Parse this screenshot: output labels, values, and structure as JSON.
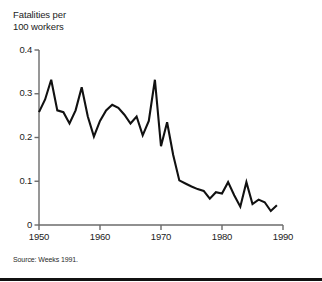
{
  "figure": {
    "title_faint": "",
    "axis_title_line1": "Fatalities per",
    "axis_title_line2": "100 workers",
    "source_note": "Source: Weeks 1991."
  },
  "chart_data": {
    "type": "line",
    "title": "",
    "subtitle": "",
    "xlabel": "",
    "ylabel": "Fatalities per 100 workers",
    "xlim": [
      1950,
      1990
    ],
    "ylim": [
      0,
      0.4
    ],
    "grid": false,
    "legend": "none",
    "line_color": "#111111",
    "axis_color": "#6b6b6b",
    "xticks": [
      1950,
      1960,
      1970,
      1980,
      1990
    ],
    "xtick_labels": [
      "1950",
      "1960",
      "1970",
      "1980",
      "1990"
    ],
    "yticks": [
      0,
      0.1,
      0.2,
      0.3,
      0.4
    ],
    "ytick_labels": [
      "0",
      "0.1",
      "0.2",
      "0.3",
      "0.4"
    ],
    "x": [
      1950,
      1951,
      1952,
      1953,
      1954,
      1955,
      1956,
      1957,
      1958,
      1959,
      1960,
      1961,
      1962,
      1963,
      1964,
      1965,
      1966,
      1967,
      1968,
      1969,
      1970,
      1971,
      1972,
      1973,
      1974,
      1975,
      1976,
      1977,
      1978,
      1979,
      1980,
      1981,
      1982,
      1983,
      1984,
      1985,
      1986,
      1987,
      1988,
      1989
    ],
    "values": [
      0.258,
      0.287,
      0.332,
      0.262,
      0.258,
      0.232,
      0.262,
      0.315,
      0.248,
      0.202,
      0.238,
      0.262,
      0.275,
      0.268,
      0.252,
      0.232,
      0.248,
      0.205,
      0.238,
      0.332,
      0.18,
      0.235,
      0.16,
      0.102,
      0.095,
      0.088,
      0.082,
      0.078,
      0.06,
      0.075,
      0.072,
      0.098,
      0.068,
      0.042,
      0.098,
      0.048,
      0.058,
      0.052,
      0.032,
      0.045
    ]
  }
}
